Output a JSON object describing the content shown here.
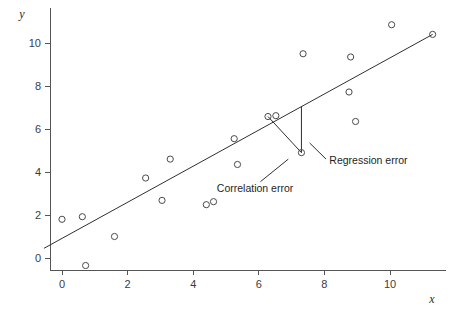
{
  "chart_data": {
    "type": "scatter",
    "title": "",
    "subtitle": "",
    "xlabel": "x",
    "ylabel": "y",
    "xlim": [
      -0.9,
      11.9
    ],
    "ylim": [
      -1.1,
      11.4
    ],
    "grid": false,
    "legend": null,
    "xticks": [
      0,
      2,
      4,
      6,
      8,
      10
    ],
    "xtick_labels": [
      "0",
      "2",
      "4",
      "6",
      "8",
      "10"
    ],
    "yticks": [
      0,
      2,
      4,
      6,
      8,
      10
    ],
    "ytick_labels": [
      "0",
      "2",
      "4",
      "6",
      "8",
      "10"
    ],
    "marker": "open-circle",
    "point_color": "#4a4a4a",
    "line_color": "#2f2f2f",
    "axis_color": "#555555",
    "background": "#ffffff",
    "points": [
      {
        "x": 0.0,
        "y": 1.8
      },
      {
        "x": 0.62,
        "y": 1.92
      },
      {
        "x": 0.72,
        "y": -0.35
      },
      {
        "x": 1.6,
        "y": 1.0
      },
      {
        "x": 2.55,
        "y": 3.72
      },
      {
        "x": 3.05,
        "y": 2.68
      },
      {
        "x": 3.3,
        "y": 4.6
      },
      {
        "x": 4.4,
        "y": 2.48
      },
      {
        "x": 4.62,
        "y": 2.62
      },
      {
        "x": 5.25,
        "y": 5.55
      },
      {
        "x": 5.35,
        "y": 4.35
      },
      {
        "x": 6.28,
        "y": 6.58
      },
      {
        "x": 6.52,
        "y": 6.62
      },
      {
        "x": 7.3,
        "y": 4.9
      },
      {
        "x": 7.35,
        "y": 9.5
      },
      {
        "x": 8.75,
        "y": 7.72
      },
      {
        "x": 8.8,
        "y": 9.35
      },
      {
        "x": 8.95,
        "y": 6.35
      },
      {
        "x": 10.05,
        "y": 10.85
      },
      {
        "x": 11.3,
        "y": 10.4
      }
    ],
    "regression_line": {
      "x_start": -0.55,
      "y_start": 0.45,
      "x_end": 11.3,
      "y_end": 10.4
    },
    "annotations": [
      {
        "id": "correlation-error",
        "label": "Correlation error",
        "text_x": 4.72,
        "text_y": 3.05,
        "leader_from_x": 6.05,
        "leader_from_y": 3.55,
        "leader_to_x": 6.9,
        "leader_to_y": 4.6
      },
      {
        "id": "regression-error",
        "label": "Regression error",
        "text_x": 8.15,
        "text_y": 4.35,
        "leader_from_x": 8.05,
        "leader_from_y": 4.6,
        "leader_to_x": 7.55,
        "leader_to_y": 5.35
      }
    ],
    "error_segments": [
      {
        "id": "correlation-error-segment",
        "x1": 6.28,
        "y1": 6.58,
        "x2": 7.3,
        "y2": 4.9
      },
      {
        "id": "regression-error-segment",
        "x1": 7.3,
        "y1": 7.05,
        "x2": 7.3,
        "y2": 4.9
      }
    ]
  }
}
